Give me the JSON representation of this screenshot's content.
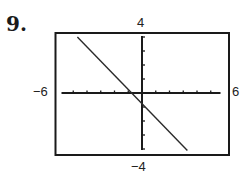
{
  "problem_number": "9.",
  "window": {
    "xmin_label": "−6",
    "xmax_label": "6",
    "ymax_label": "4",
    "ymin_label": "−4"
  },
  "chart_data": {
    "type": "line",
    "title": "",
    "xlabel": "",
    "ylabel": "",
    "xlim": [
      -6,
      6
    ],
    "ylim": [
      -4,
      4
    ],
    "x_tick_step": 1,
    "y_tick_step": 1,
    "grid": false,
    "series": [
      {
        "name": "line",
        "x": [
          -4.7,
          3.3
        ],
        "y": [
          4.0,
          -4.1
        ],
        "approx_slope": -1,
        "approx_y_intercept": -0.8,
        "approx_x_intercept": -0.85
      }
    ]
  }
}
